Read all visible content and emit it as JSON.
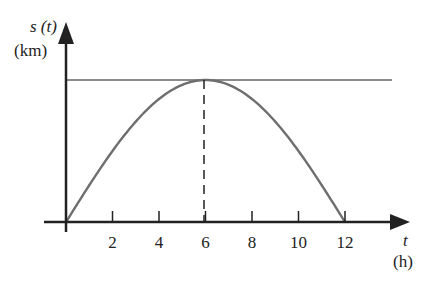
{
  "chart_data": {
    "type": "line",
    "title": "",
    "xlabel": "t",
    "xunit": "(h)",
    "ylabel": "s (t)",
    "yunit": "(km)",
    "xticks": [
      2,
      4,
      6,
      8,
      10,
      12
    ],
    "xlim": [
      0,
      14
    ],
    "grid": false,
    "series": [
      {
        "name": "s(t)",
        "shape": "half-sine",
        "x": [
          0,
          1,
          2,
          3,
          4,
          5,
          6,
          7,
          8,
          9,
          10,
          11,
          12
        ],
        "y": [
          0,
          0.259,
          0.5,
          0.707,
          0.866,
          0.966,
          1,
          0.966,
          0.866,
          0.707,
          0.5,
          0.259,
          0
        ]
      }
    ],
    "annotations": [
      {
        "type": "hline",
        "y": 1,
        "label": "maximum"
      },
      {
        "type": "vline-dashed",
        "x": 6,
        "from": 0,
        "to": 1
      }
    ]
  },
  "labels": {
    "y_axis": "s (t)",
    "y_unit": "(km)",
    "x_axis": "t",
    "x_unit": "(h)",
    "ticks": [
      "2",
      "4",
      "6",
      "8",
      "10",
      "12"
    ]
  }
}
